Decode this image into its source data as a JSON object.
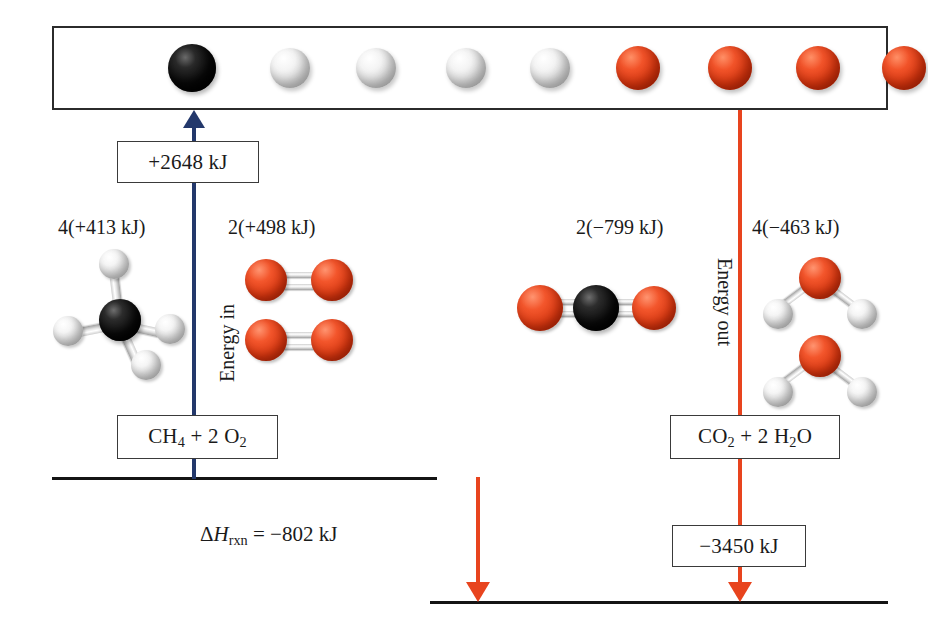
{
  "figure": {
    "atoms_box": {
      "name": "gaseous-atoms-state",
      "atoms": [
        {
          "element": "C",
          "kind": "carbon",
          "x": 138
        },
        {
          "element": "H",
          "kind": "hydrogen",
          "x": 236
        },
        {
          "element": "H",
          "kind": "hydrogen",
          "x": 322
        },
        {
          "element": "H",
          "kind": "hydrogen",
          "x": 412
        },
        {
          "element": "H",
          "kind": "hydrogen",
          "x": 496
        },
        {
          "element": "O",
          "kind": "oxygen",
          "x": 584
        },
        {
          "element": "O",
          "kind": "oxygen",
          "x": 676
        },
        {
          "element": "O",
          "kind": "oxygen",
          "x": 764
        },
        {
          "element": "O",
          "kind": "oxygen",
          "x": 850
        }
      ]
    },
    "energy_in_box": "+2648 kJ",
    "energy_out_box": "−3450 kJ",
    "reactants_box": {
      "formula_html": "CH<sub>4</sub> + 2 O<sub>2</sub>",
      "text": "CH4 + 2 O2"
    },
    "products_box": {
      "formula_html": "CO<sub>2</sub> + 2 H<sub>2</sub>O",
      "text": "CO2 + 2 H2O"
    },
    "bond_labels": {
      "ch": "4(+413 kJ)",
      "oo": "2(+498 kJ)",
      "co": "2(−799 kJ)",
      "oh": "4(−463 kJ)"
    },
    "axis_labels": {
      "energy_in": "Energy in",
      "energy_out": "Energy out"
    },
    "delta_h": {
      "html": "Δ<i class=\"var\">H</i><sub>rxn</sub> = −802 kJ",
      "text": "ΔHrxn = −802 kJ"
    },
    "colors": {
      "energy_in_arrow": "#23386b",
      "energy_out_arrow": "#e8441e",
      "baseline": "#141414",
      "carbon": "#000000",
      "hydrogen": "#ffffff",
      "oxygen": "#e8441e"
    }
  },
  "chart_data": {
    "type": "diagram",
    "ylabel": "Enthalpy",
    "levels": [
      {
        "name": "Gaseous atoms (C + 4 H + 4 O)",
        "relative_kJ": 2648
      },
      {
        "name": "CH4 + 2 O2 (reactants)",
        "relative_kJ": 0
      },
      {
        "name": "CO2 + 2 H2O (products)",
        "relative_kJ": -802
      }
    ],
    "transitions": [
      {
        "name": "Energy in (bonds broken)",
        "value_kJ": 2648,
        "label": "+2648 kJ",
        "direction": "up",
        "color": "#23386b"
      },
      {
        "name": "Energy out (bonds formed)",
        "value_kJ": -3450,
        "label": "−3450 kJ",
        "direction": "down",
        "color": "#e8441e"
      },
      {
        "name": "Overall reaction enthalpy",
        "value_kJ": -802,
        "label": "ΔHrxn = −802 kJ",
        "direction": "down",
        "color": "#e8441e"
      }
    ],
    "bond_energies": [
      {
        "bond": "C—H",
        "count": 4,
        "per_bond_kJ": 413,
        "label": "4(+413 kJ)",
        "total_kJ": 1652
      },
      {
        "bond": "O=O",
        "count": 2,
        "per_bond_kJ": 498,
        "label": "2(+498 kJ)",
        "total_kJ": 996
      },
      {
        "bond": "C=O",
        "count": 2,
        "per_bond_kJ": -799,
        "label": "2(−799 kJ)",
        "total_kJ": -1598
      },
      {
        "bond": "O—H",
        "count": 4,
        "per_bond_kJ": -463,
        "label": "4(−463 kJ)",
        "total_kJ": -1852
      }
    ]
  }
}
